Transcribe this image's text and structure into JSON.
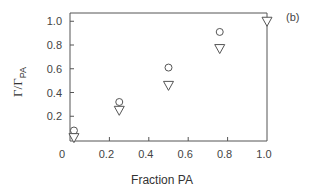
{
  "chart_data": {
    "type": "scatter",
    "title": "",
    "panel_label": "(b)",
    "xlabel": "Fraction PA",
    "ylabel": "Γ/Γ",
    "ylabel_sub": "PA",
    "xlim": [
      0,
      1.0
    ],
    "ylim": [
      0,
      1.05
    ],
    "xticks": [
      "0",
      "0.2",
      "0.4",
      "0.6",
      "0.8",
      "1.0"
    ],
    "yticks": [
      "0.2",
      "0.4",
      "0.6",
      "0.8",
      "1.0"
    ],
    "grid": false,
    "legend": null,
    "series": [
      {
        "name": "circles",
        "marker": "circle-open",
        "x": [
          0.02,
          0.25,
          0.5,
          0.76
        ],
        "y": [
          0.08,
          0.32,
          0.61,
          0.91
        ]
      },
      {
        "name": "triangles",
        "marker": "triangle-down-open",
        "x": [
          0.02,
          0.25,
          0.5,
          0.76,
          1.0
        ],
        "y": [
          0.02,
          0.25,
          0.46,
          0.77,
          1.0
        ]
      }
    ]
  }
}
